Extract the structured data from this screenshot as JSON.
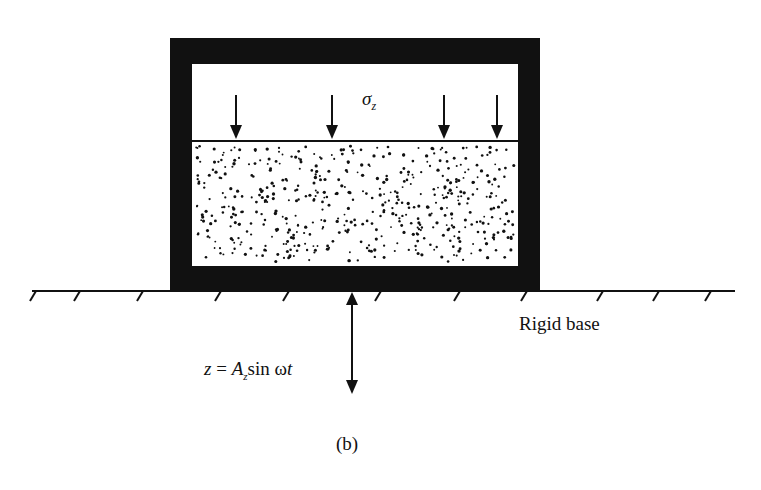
{
  "figure": {
    "caption": "(b)",
    "type": "schematic of soil sample in rigid container on vibrating base"
  },
  "labels": {
    "stress_symbol": "σ",
    "stress_subscript": "z",
    "base_label": "Rigid base",
    "equation_lhs": "z",
    "equation_eq": " = ",
    "equation_amp": "A",
    "equation_amp_sub": "z",
    "equation_sin": "sin ",
    "equation_omega": "ω",
    "equation_t": "t"
  },
  "elements": {
    "container": "thick black rigid box",
    "soil": "stippled granular specimen",
    "load_arrows_count": 4,
    "ground_line": "hatched rigid base",
    "vibration_arrow": "double-headed vertical arrow"
  },
  "colors": {
    "ink": "#111111",
    "background": "#ffffff"
  }
}
